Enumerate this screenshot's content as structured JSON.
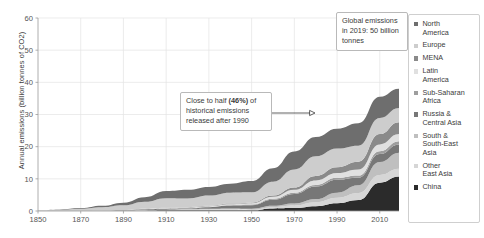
{
  "chart_data": {
    "type": "area",
    "stacked": true,
    "title": "",
    "xlabel": "",
    "ylabel": "Annual emissions (billion tonnes of CO2)",
    "xlim": [
      1850,
      2019
    ],
    "ylim": [
      0,
      60
    ],
    "xticks": [
      1850,
      1870,
      1890,
      1910,
      1930,
      1950,
      1970,
      1990,
      2010
    ],
    "yticks": [
      0,
      10,
      20,
      30,
      40,
      50,
      60
    ],
    "grid": true,
    "legend_position": "right",
    "x": [
      1850,
      1860,
      1870,
      1880,
      1890,
      1900,
      1910,
      1920,
      1930,
      1940,
      1950,
      1960,
      1970,
      1980,
      1990,
      2000,
      2010,
      2019
    ],
    "series": [
      {
        "name": "China",
        "color": "#2b2b2b",
        "values": [
          0.0,
          0.0,
          0.0,
          0.0,
          0.1,
          0.1,
          0.2,
          0.2,
          0.2,
          0.2,
          0.2,
          0.8,
          0.9,
          1.5,
          2.4,
          3.4,
          8.8,
          10.7
        ]
      },
      {
        "name": "Other East Asia",
        "color": "#d6d6d6",
        "values": [
          0.0,
          0.0,
          0.0,
          0.0,
          0.0,
          0.1,
          0.1,
          0.2,
          0.3,
          0.4,
          0.2,
          0.4,
          0.8,
          1.2,
          1.7,
          2.2,
          2.4,
          2.4
        ]
      },
      {
        "name": "South & South-East Asia",
        "color": "#bfbfbf",
        "values": [
          0.0,
          0.0,
          0.0,
          0.0,
          0.1,
          0.1,
          0.1,
          0.2,
          0.2,
          0.2,
          0.3,
          0.4,
          0.6,
          1.0,
          1.6,
          2.4,
          4.0,
          5.0
        ]
      },
      {
        "name": "Russia & Central Asia",
        "color": "#777777",
        "values": [
          0.0,
          0.0,
          0.0,
          0.1,
          0.1,
          0.2,
          0.3,
          0.2,
          0.5,
          0.9,
          1.1,
          1.9,
          3.0,
          3.9,
          4.0,
          2.3,
          2.5,
          2.6
        ]
      },
      {
        "name": "Sub-Saharan Africa",
        "color": "#9e9e9e",
        "values": [
          0.0,
          0.0,
          0.0,
          0.0,
          0.0,
          0.1,
          0.1,
          0.1,
          0.1,
          0.1,
          0.2,
          0.3,
          0.4,
          0.5,
          0.6,
          0.7,
          0.9,
          1.0
        ]
      },
      {
        "name": "Latin America",
        "color": "#e0e0e0",
        "values": [
          0.0,
          0.0,
          0.0,
          0.0,
          0.0,
          0.1,
          0.1,
          0.2,
          0.2,
          0.3,
          0.4,
          0.6,
          0.9,
          1.4,
          1.5,
          1.9,
          2.1,
          2.2
        ]
      },
      {
        "name": "MENA",
        "color": "#8a8a8a",
        "values": [
          0.0,
          0.0,
          0.0,
          0.0,
          0.0,
          0.0,
          0.1,
          0.1,
          0.1,
          0.2,
          0.2,
          0.4,
          0.7,
          1.4,
          1.8,
          2.4,
          3.2,
          3.7
        ]
      },
      {
        "name": "Europe",
        "color": "#cdcdcd",
        "values": [
          0.2,
          0.4,
          0.7,
          1.1,
          1.5,
          2.2,
          3.0,
          2.7,
          3.2,
          3.4,
          3.2,
          4.3,
          5.6,
          6.1,
          5.8,
          5.0,
          5.0,
          4.4
        ]
      },
      {
        "name": "North America",
        "color": "#6e6e6e",
        "values": [
          0.0,
          0.1,
          0.2,
          0.4,
          0.8,
          1.4,
          2.2,
          2.7,
          2.7,
          2.8,
          3.5,
          4.2,
          5.6,
          6.0,
          6.2,
          7.0,
          6.6,
          6.0
        ]
      }
    ],
    "annotations": [
      {
        "id": "callout-2019",
        "text_parts": [
          "Global emissions in 2019: 50 billion tonnes"
        ],
        "line1": "Global emissions",
        "line2": "in 2019: 50 billion",
        "line3": "tonnes"
      },
      {
        "id": "callout-half",
        "line1_pre": "Close to half ",
        "line1_bold": "(46%)",
        "line1_post": " of",
        "line2": "historical emissions",
        "line3": "released after 1990"
      }
    ]
  },
  "legend": {
    "items": [
      {
        "label_line1": "North",
        "label_line2": "America",
        "color": "#6e6e6e"
      },
      {
        "label_line1": "Europe",
        "label_line2": "",
        "color": "#cdcdcd"
      },
      {
        "label_line1": "MENA",
        "label_line2": "",
        "color": "#8a8a8a"
      },
      {
        "label_line1": "Latin",
        "label_line2": "America",
        "color": "#e0e0e0"
      },
      {
        "label_line1": "Sub-Saharan",
        "label_line2": "Africa",
        "color": "#9e9e9e"
      },
      {
        "label_line1": "Russia &",
        "label_line2": "Central Asia",
        "color": "#777777"
      },
      {
        "label_line1": "South &",
        "label_line2": "South-East",
        "label_line3": "Asia",
        "color": "#bfbfbf"
      },
      {
        "label_line1": "Other",
        "label_line2": "East Asia",
        "color": "#d6d6d6"
      },
      {
        "label_line1": "China",
        "label_line2": "",
        "color": "#2b2b2b"
      }
    ]
  }
}
